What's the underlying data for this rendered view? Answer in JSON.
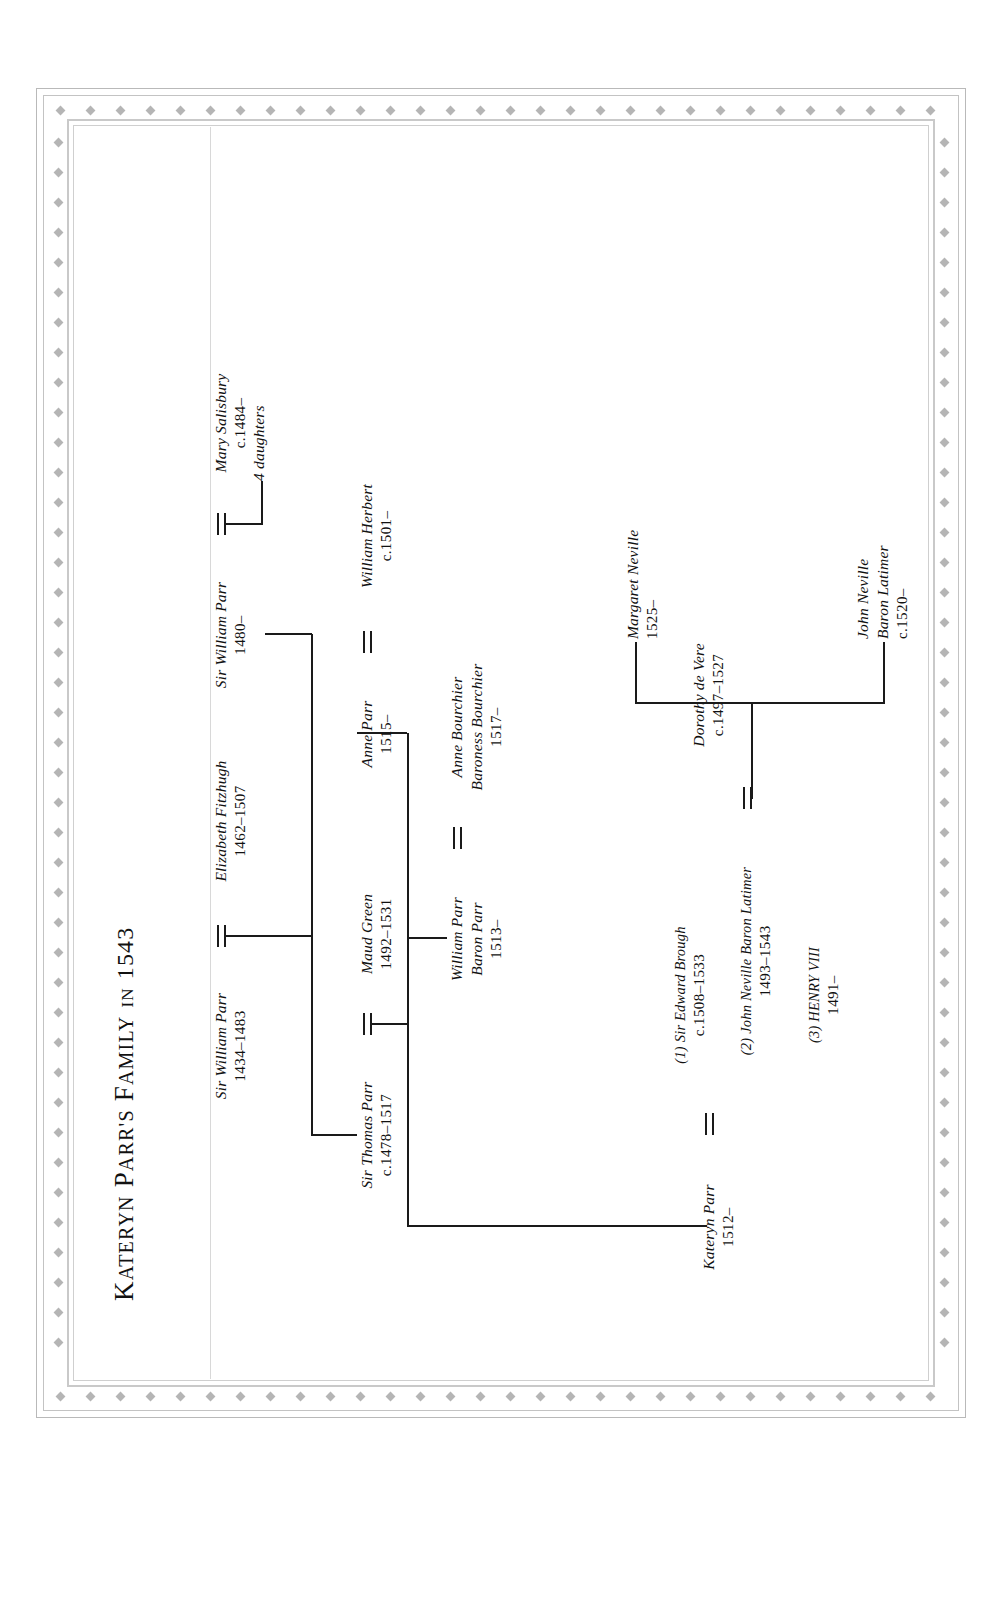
{
  "title": {
    "main": "KATERYN PARR",
    "possessive": "'S ",
    "word2": "FAMILY",
    "in": " IN ",
    "year": "1543",
    "full": "KATERYN PARR'S FAMILY IN 1543"
  },
  "nodes": {
    "sir_william_parr_1434": {
      "name": "Sir William Parr",
      "dates": "1434–1483"
    },
    "elizabeth_fitzhugh": {
      "name": "Elizabeth Fitzhugh",
      "dates": "1462–1507"
    },
    "sir_thomas_parr": {
      "name": "Sir Thomas Parr",
      "dates": "c.1478–1517"
    },
    "maud_green": {
      "name": "Maud Green",
      "dates": "1492–1531"
    },
    "sir_william_parr_1480": {
      "name": "Sir William Parr",
      "dates": "1480–"
    },
    "mary_salisbury": {
      "name": "Mary Salisbury",
      "dates": "c.1484–"
    },
    "four_daughters": {
      "name": "4 daughters",
      "dates": ""
    },
    "william_parr_1513": {
      "name": "William Parr",
      "title": "Baron Parr",
      "dates": "1513–"
    },
    "anne_bourchier": {
      "name": "Anne Bourchier",
      "title": "Baroness Bourchier",
      "dates": "1517–"
    },
    "anne_parr": {
      "name": "Anne Parr",
      "dates": "1515–"
    },
    "william_herbert": {
      "name": "William Herbert",
      "dates": "c.1501–"
    },
    "kateryn_parr": {
      "name": "Kateryn Parr",
      "dates": "1512–"
    },
    "husband1": {
      "name": "(1) Sir Edward Brough",
      "dates": "c.1508–1533"
    },
    "husband2": {
      "name": "(2) John Neville Baron Latimer",
      "dates": "1493–1543"
    },
    "husband3": {
      "name": "(3) HENRY VIII",
      "dates": "1491–"
    },
    "john_neville_latimer": {
      "name": "John Neville Baron Latimer",
      "dates": ""
    },
    "dorothy_de_vere": {
      "name": "Dorothy de Vere",
      "dates": "c.1497–1527"
    },
    "john_neville_1520": {
      "name": "John Neville",
      "title": "Baron Latimer",
      "dates": "c.1520–"
    },
    "margaret_neville": {
      "name": "Margaret Neville",
      "dates": "1525–"
    }
  },
  "colors": {
    "ink": "#1a1a1a",
    "frame": "#c3c3c3",
    "dot": "#b5b5b5",
    "paper": "#ffffff"
  }
}
